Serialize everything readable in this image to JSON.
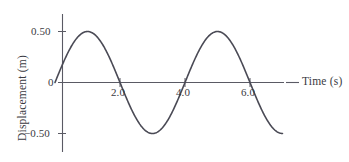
{
  "chart_data": {
    "type": "line",
    "title": "",
    "xlabel": "Time (s)",
    "ylabel": "Displacement (m)",
    "xlim": [
      0,
      7.0
    ],
    "ylim": [
      -0.75,
      0.75
    ],
    "xticks": [
      2.0,
      4.0,
      6.0
    ],
    "xtick_labels": [
      "2.0",
      "4.0",
      "6.0"
    ],
    "yticks": [
      0.5,
      0,
      -0.5
    ],
    "ytick_labels": [
      "0.50",
      "0",
      "−0.50"
    ],
    "grid": false,
    "legend": null,
    "series": [
      {
        "name": "displacement",
        "function": "y = 0.50 * sin(2*pi*t/4)",
        "amplitude": 0.5,
        "period": 4.0,
        "phase": 0,
        "color": "#4a4a55",
        "x": [
          0.0,
          0.25,
          0.5,
          0.75,
          1.0,
          1.25,
          1.5,
          1.75,
          2.0,
          2.25,
          2.5,
          2.75,
          3.0,
          3.25,
          3.5,
          3.75,
          4.0,
          4.25,
          4.5,
          4.75,
          5.0,
          5.25,
          5.5,
          5.75,
          6.0,
          6.25,
          6.5,
          6.75,
          7.0
        ],
        "y": [
          0.0,
          0.191,
          0.354,
          0.462,
          0.5,
          0.462,
          0.354,
          0.191,
          0.0,
          -0.191,
          -0.354,
          -0.462,
          -0.5,
          -0.462,
          -0.354,
          -0.191,
          0.0,
          0.191,
          0.354,
          0.462,
          0.5,
          0.462,
          0.354,
          0.191,
          0.0,
          -0.191,
          -0.354,
          -0.462,
          -0.5
        ]
      }
    ],
    "annotations": {
      "peaks": [
        {
          "t": 1.0,
          "value": 0.5
        },
        {
          "t": 5.0,
          "value": 0.5
        }
      ],
      "troughs": [
        {
          "t": 3.0,
          "value": -0.5
        },
        {
          "t": 7.0,
          "value": -0.5
        }
      ],
      "zero_crossings": [
        0.0,
        2.0,
        4.0,
        6.0
      ]
    },
    "colors": {
      "curve": "#4a4a55",
      "axis": "#5a5a64",
      "text": "#3a3a42",
      "background": "#ffffff"
    }
  }
}
